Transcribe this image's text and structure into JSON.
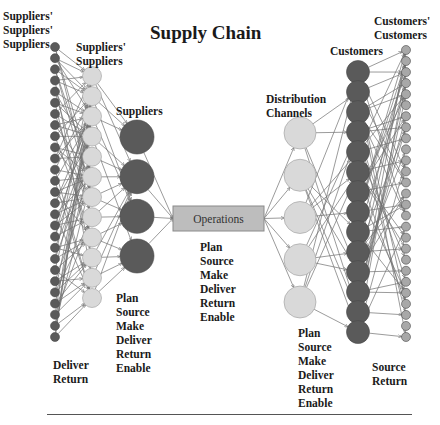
{
  "title": "Supply Chain",
  "colors": {
    "dark_node": "#5a5a5a",
    "light_node": "#d9d9d9",
    "customers_customers_node": "#a8a8a8",
    "edge": "#707070",
    "operations_box": "#bdbdbd",
    "operations_border": "#8a8a8a",
    "text": "#1a1a1a"
  },
  "tiers": [
    {
      "id": "suppliers-suppliers-suppliers",
      "label": "Suppliers'\nSuppliers'\nSuppliers",
      "count": 27,
      "x": 55,
      "y_start": 47,
      "y_end": 337,
      "r": 4.5,
      "fill": "dark"
    },
    {
      "id": "suppliers-suppliers",
      "label": "Suppliers'\nSuppliers",
      "count": 12,
      "x": 92,
      "y_start": 76,
      "y_end": 298,
      "r": 9.5,
      "fill": "light"
    },
    {
      "id": "suppliers",
      "label": "Suppliers",
      "count": 4,
      "x": 137,
      "y_start": 137,
      "y_end": 256,
      "r": 17,
      "fill": "dark"
    },
    {
      "id": "distribution-channels",
      "label": "Distribution\nChannels",
      "count": 5,
      "x": 300,
      "y_start": 133,
      "y_end": 302,
      "r": 16,
      "fill": "light"
    },
    {
      "id": "customers",
      "label": "Customers",
      "count": 14,
      "x": 358,
      "y_start": 72,
      "y_end": 332,
      "r": 11.5,
      "fill": "dark"
    },
    {
      "id": "customers-customers",
      "label": "Customers'\nCustomers",
      "count": 27,
      "x": 406,
      "y_start": 50,
      "y_end": 337,
      "r": 4.5,
      "fill": "cc"
    }
  ],
  "operations": {
    "label": "Operations",
    "x": 173,
    "y": 206,
    "w": 91,
    "h": 25
  },
  "labels": {
    "ss_s": "Suppliers'\nSuppliers'\nSuppliers",
    "s_s": "Suppliers'\nSuppliers",
    "suppliers": "Suppliers",
    "distribution": "Distribution\nChannels",
    "customers": "Customers",
    "c_c": "Customers'\nCustomers"
  },
  "processes": {
    "leftmost": "Deliver\nReturn",
    "suppliers": "Plan\nSource\nMake\nDeliver\nReturn\nEnable",
    "operations": "Plan\nSource\nMake\nDeliver\nReturn\nEnable",
    "distribution": "Plan\nSource\nMake\nDeliver\nReturn\nEnable",
    "rightmost": "Source\nReturn"
  }
}
